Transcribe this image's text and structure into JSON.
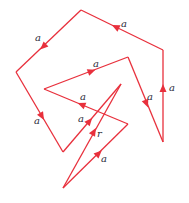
{
  "diagram": {
    "stroke_color": "#e8303c",
    "label_color": "#2b2b3a",
    "vertices": {
      "bottom": [
        63,
        188
      ],
      "right_tip": [
        128,
        124
      ],
      "inner_left": [
        44,
        89
      ],
      "inner_top": [
        128,
        57
      ],
      "right_bottom": [
        163,
        142
      ],
      "right_top": [
        163,
        50
      ],
      "top": [
        81,
        10
      ],
      "left": [
        16,
        72
      ],
      "left_bottom": [
        63,
        152
      ],
      "apex": [
        121,
        84
      ]
    },
    "edges": [
      {
        "from": "bottom",
        "to": "right_tip",
        "label": "a"
      },
      {
        "from": "right_tip",
        "to": "inner_left",
        "label": "a"
      },
      {
        "from": "inner_left",
        "to": "inner_top",
        "label": "a"
      },
      {
        "from": "inner_top",
        "to": "right_bottom",
        "label": "a"
      },
      {
        "from": "right_bottom",
        "to": "right_top",
        "label": "a"
      },
      {
        "from": "right_top",
        "to": "top",
        "label": "a"
      },
      {
        "from": "top",
        "to": "left",
        "label": "a"
      },
      {
        "from": "left",
        "to": "left_bottom",
        "label": "a"
      },
      {
        "from": "left_bottom",
        "to": "apex",
        "label": "a"
      },
      {
        "from": "bottom",
        "to": "apex",
        "label": "r"
      }
    ],
    "labels": {
      "e1": "a",
      "e2": "a",
      "e3": "a",
      "e4": "a",
      "e5": "a",
      "e6": "a",
      "e7": "a",
      "e8": "a",
      "e9": "a",
      "r": "r"
    }
  }
}
